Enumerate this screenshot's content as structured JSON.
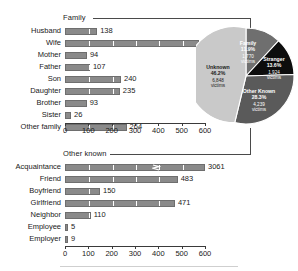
{
  "chart_data": [
    {
      "type": "bar",
      "title": "Family",
      "orientation": "horizontal",
      "categories": [
        "Husband",
        "Wife",
        "Mother",
        "Father",
        "Son",
        "Daughter",
        "Brother",
        "Sister",
        "Other family"
      ],
      "values": [
        138,
        573,
        94,
        107,
        240,
        235,
        93,
        26,
        264
      ],
      "xlabel": "",
      "ylabel": "",
      "xlim": [
        0,
        600
      ],
      "xticks": [
        0,
        100,
        200,
        300,
        400,
        500,
        600
      ],
      "xtick_labels": [
        "0",
        "100",
        "200",
        "300",
        "400",
        "500",
        "600"
      ],
      "grid": "vertical-white-separators",
      "legend": "none",
      "bar_color": "#8a8a8a"
    },
    {
      "type": "bar",
      "title": "Other known",
      "orientation": "horizontal",
      "categories": [
        "Acquaintance",
        "Friend",
        "Boyfriend",
        "Girlfriend",
        "Neighbor",
        "Employee",
        "Employer"
      ],
      "values": [
        3061,
        483,
        150,
        471,
        110,
        5,
        9
      ],
      "xlabel": "",
      "ylabel": "",
      "xlim": [
        0,
        600
      ],
      "xticks": [
        0,
        100,
        200,
        300,
        400,
        500,
        600
      ],
      "xtick_labels": [
        "0",
        "100",
        "200",
        "300",
        "400",
        "500",
        "600"
      ],
      "grid": "vertical-white-separators",
      "legend": "none",
      "bar_color": "#8a8a8a",
      "axis_break": {
        "series": "Acquaintance",
        "note": "bar truncated with zigzag break, true value 3061"
      }
    },
    {
      "type": "pie",
      "title": "",
      "slices": [
        {
          "label": "Family",
          "percent": 11.9,
          "victims": "1,770",
          "victims_word": "victims",
          "color": "#6f6f6f",
          "text_color": "#ffffff"
        },
        {
          "label": "Stranger",
          "percent": 13.6,
          "victims": "1,924",
          "victims_word": "victims",
          "color": "#0d0d0d",
          "text_color": "#ffffff"
        },
        {
          "label": "Other Known",
          "percent": 28.3,
          "victims": "4,239",
          "victims_word": "victims",
          "color": "#5a5a5a",
          "text_color": "#ffffff"
        },
        {
          "label": "Unknown",
          "percent": 46.2,
          "victims": "6,848",
          "victims_word": "victims",
          "color": "#c9c9c9",
          "text_color": "#1a1a1a"
        }
      ],
      "legend": "inline-labels",
      "start_angle_deg": 0
    }
  ],
  "family_panel": {
    "title": "Family",
    "rows": [
      {
        "label": "Husband",
        "value": "138"
      },
      {
        "label": "Wife",
        "value": "573"
      },
      {
        "label": "Mother",
        "value": "94"
      },
      {
        "label": "Father",
        "value": "107"
      },
      {
        "label": "Son",
        "value": "240"
      },
      {
        "label": "Daughter",
        "value": "235"
      },
      {
        "label": "Brother",
        "value": "93"
      },
      {
        "label": "Sister",
        "value": "26"
      },
      {
        "label": "Other family",
        "value": "264"
      }
    ],
    "axis_labels": [
      "0",
      "100",
      "200",
      "300",
      "400",
      "500",
      "600"
    ]
  },
  "other_known_panel": {
    "title": "Other known",
    "rows": [
      {
        "label": "Acquaintance",
        "value": "3061"
      },
      {
        "label": "Friend",
        "value": "483"
      },
      {
        "label": "Boyfriend",
        "value": "150"
      },
      {
        "label": "Girlfriend",
        "value": "471"
      },
      {
        "label": "Neighbor",
        "value": "110"
      },
      {
        "label": "Employee",
        "value": "5"
      },
      {
        "label": "Employer",
        "value": "9"
      }
    ],
    "axis_labels": [
      "0",
      "100",
      "200",
      "300",
      "400",
      "500",
      "600"
    ]
  },
  "pie_panel": {
    "slices": [
      {
        "name": "Family",
        "percent": "11.9%",
        "victims": "1,770",
        "victims_word": "victims"
      },
      {
        "name": "Stranger",
        "percent": "13.6%",
        "victims": "1,924",
        "victims_word": "victims"
      },
      {
        "name": "Other Known",
        "percent": "28.3%",
        "victims": "4,239",
        "victims_word": "victims"
      },
      {
        "name": "Unknown",
        "percent": "46.2%",
        "victims": "6,848",
        "victims_word": "victims"
      }
    ]
  },
  "colors": {
    "bar_fill": "#8a8a8a",
    "bar_stroke": "#6e6e6e",
    "pie_family": "#6f6f6f",
    "pie_stranger": "#0d0d0d",
    "pie_other_known": "#5a5a5a",
    "pie_unknown": "#c9c9c9",
    "axis": "#3a3a3a",
    "leader": "#4a4a4a"
  }
}
